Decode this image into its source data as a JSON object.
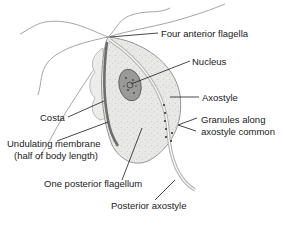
{
  "diagram": {
    "labels": {
      "anterior_flagella": "Four anterior flagella",
      "nucleus": "Nucleus",
      "axostyle": "Axostyle",
      "costa": "Costa",
      "undulating_membrane_1": "Undulating membrane",
      "undulating_membrane_2": "(half of body length)",
      "granules_1": "Granules along",
      "granules_2": "axostyle common",
      "posterior_flagellum": "One posterior flagellum",
      "posterior_axostyle": "Posterior axostyle"
    },
    "colors": {
      "body_fill": "#e6e6e4",
      "body_stroke": "#8a8a8a",
      "nucleus_fill": "#9a9a98",
      "costa": "#6e6e6e",
      "text": "#1a1a1a",
      "leader": "#1a1a1a"
    }
  }
}
